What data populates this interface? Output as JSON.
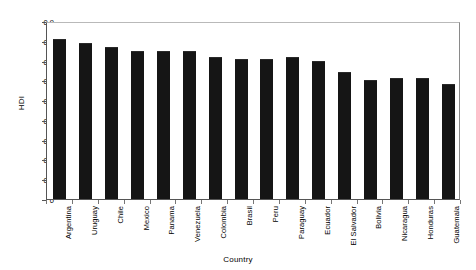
{
  "chart_data": {
    "type": "bar",
    "title": "",
    "subtitle": "",
    "xlabel": "Country",
    "ylabel": "HDI",
    "ylim": [
      0,
      0.9
    ],
    "yticks": [
      "0",
      "0.1",
      "0.2",
      "0.3",
      "0.4",
      "0.5",
      "0.6",
      "0.7",
      "0.8",
      "0.9"
    ],
    "ytick_values": [
      0,
      0.1,
      0.2,
      0.3,
      0.4,
      0.5,
      0.6,
      0.7,
      0.8,
      0.9
    ],
    "grid": false,
    "legend": "none",
    "bar_color": "#151515",
    "categories": [
      "Argentina",
      "Uruguay",
      "Chile",
      "Mexico",
      "Panama",
      "Venezuela",
      "Colombia",
      "Brasil",
      "Peru",
      "Paraguay",
      "Ecuador",
      "El Salvador",
      "Bolivia",
      "Nicaragua",
      "Honduras",
      "Guatemala"
    ],
    "values": [
      0.81,
      0.79,
      0.77,
      0.75,
      0.75,
      0.75,
      0.72,
      0.71,
      0.71,
      0.72,
      0.7,
      0.64,
      0.6,
      0.61,
      0.61,
      0.58
    ]
  }
}
